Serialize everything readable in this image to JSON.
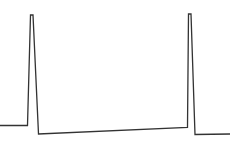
{
  "chart_data": {
    "type": "line",
    "title": "",
    "xlabel": "",
    "ylabel": "",
    "grid": false,
    "legend": null,
    "series": [
      {
        "name": "waveform",
        "color": "#333333",
        "stroke_width": 1.3,
        "points": [
          [
            0,
            125.5
          ],
          [
            27.5,
            125.5
          ],
          [
            30.5,
            15
          ],
          [
            33,
            15
          ],
          [
            38.5,
            134
          ],
          [
            187.5,
            127.5
          ],
          [
            188.5,
            14
          ],
          [
            191,
            14
          ],
          [
            195,
            134.5
          ],
          [
            230,
            134
          ]
        ]
      }
    ],
    "viewport": {
      "width": 236,
      "height": 148
    }
  }
}
